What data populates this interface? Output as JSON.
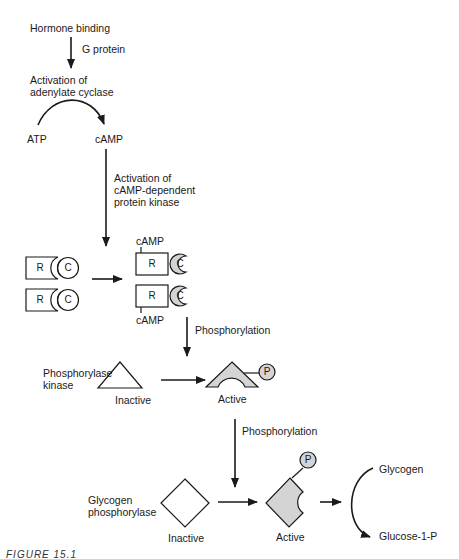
{
  "diagram": {
    "steps": {
      "hormone_binding": "Hormone binding",
      "g_protein": "G protein",
      "activation_adenylate_cyclase": "Activation of\nadenylate cyclase",
      "atp": "ATP",
      "camp": "cAMP",
      "activation_kinase": "Activation of\ncAMP-dependent\nprotein kinase",
      "phosphorylation_1": "Phosphorylation",
      "phosphorylase_kinase": "Phosphorylase\nkinase",
      "phosphorylation_2": "Phosphorylation",
      "glycogen_phosphorylase": "Glycogen\nphosphorylase",
      "glycogen": "Glycogen",
      "glucose_1_p": "Glucose-1-P"
    },
    "pka": {
      "regulatory_label": "R",
      "catalytic_label": "C",
      "camp_top": "cAMP",
      "camp_bottom": "cAMP"
    },
    "states": {
      "kinase_inactive": "Inactive",
      "kinase_active": "Active",
      "phosphorylase_inactive": "Inactive",
      "phosphorylase_active": "Active"
    },
    "phosphate_label": "P",
    "caption": "FIGURE 15.1",
    "colors": {
      "stroke": "#1a1a1a",
      "active_fill": "#d4d4d4"
    }
  }
}
